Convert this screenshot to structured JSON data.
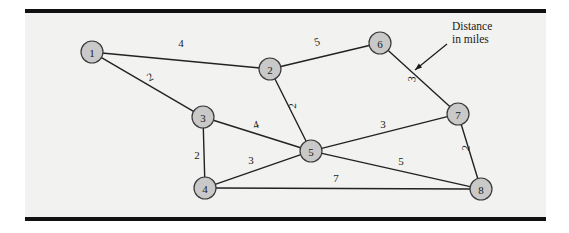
{
  "figure": {
    "kind": "weighted-undirected-graph",
    "background_color": "#f2f2f0",
    "page_color": "#ffffff",
    "rule_color": "#111111",
    "node_fill": "#c9c9c9",
    "node_stroke": "#3a3a3a",
    "edge_color": "#222222",
    "label_color": "#1a1a1a"
  },
  "annotation": {
    "line1": "Distance",
    "line2": "in miles",
    "x": 452,
    "y": 20,
    "arrow": {
      "x1": 447,
      "y1": 44,
      "x2": 415,
      "y2": 70
    }
  },
  "nodes": [
    {
      "id": "1",
      "label": "1",
      "x": 92,
      "y": 52,
      "r": 11
    },
    {
      "id": "2",
      "label": "2",
      "x": 270,
      "y": 69,
      "r": 11
    },
    {
      "id": "3",
      "label": "3",
      "x": 203,
      "y": 117,
      "r": 11
    },
    {
      "id": "4",
      "label": "4",
      "x": 205,
      "y": 188,
      "r": 11
    },
    {
      "id": "5",
      "label": "5",
      "x": 311,
      "y": 151,
      "r": 11
    },
    {
      "id": "6",
      "label": "6",
      "x": 380,
      "y": 43,
      "r": 11
    },
    {
      "id": "7",
      "label": "7",
      "x": 458,
      "y": 114,
      "r": 11
    },
    {
      "id": "8",
      "label": "8",
      "x": 481,
      "y": 189,
      "r": 11
    }
  ],
  "edges": [
    {
      "from": "1",
      "to": "2",
      "weight": "4",
      "label_x": 181,
      "label_y": 43,
      "rotate": 0
    },
    {
      "from": "1",
      "to": "3",
      "weight": "2",
      "label_x": 150,
      "label_y": 77,
      "rotate": -28
    },
    {
      "from": "2",
      "to": "6",
      "weight": "5",
      "label_x": 317,
      "label_y": 42,
      "rotate": -14
    },
    {
      "from": "2",
      "to": "5",
      "weight": "2",
      "label_x": 292,
      "label_y": 106,
      "rotate": -90
    },
    {
      "from": "3",
      "to": "5",
      "weight": "4",
      "label_x": 256,
      "label_y": 125,
      "rotate": -16
    },
    {
      "from": "3",
      "to": "4",
      "weight": "2",
      "label_x": 197,
      "label_y": 155,
      "rotate": 0
    },
    {
      "from": "4",
      "to": "5",
      "weight": "3",
      "label_x": 251,
      "label_y": 160,
      "rotate": 0
    },
    {
      "from": "4",
      "to": "8",
      "weight": "7",
      "label_x": 336,
      "label_y": 178,
      "rotate": 0
    },
    {
      "from": "5",
      "to": "7",
      "weight": "3",
      "label_x": 383,
      "label_y": 124,
      "rotate": 0
    },
    {
      "from": "5",
      "to": "8",
      "weight": "5",
      "label_x": 401,
      "label_y": 161,
      "rotate": 0
    },
    {
      "from": "6",
      "to": "7",
      "weight": "3",
      "label_x": 412,
      "label_y": 79,
      "rotate": -82
    },
    {
      "from": "7",
      "to": "8",
      "weight": "2",
      "label_x": 466,
      "label_y": 148,
      "rotate": -82
    }
  ]
}
